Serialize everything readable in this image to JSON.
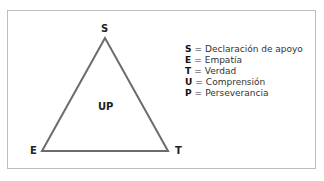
{
  "diagram": {
    "center_label": "UP",
    "vertices": {
      "top": "S",
      "bottom_left": "E",
      "bottom_right": "T"
    },
    "legend": [
      {
        "key": "S",
        "eq": "=",
        "text": "Declaración de apoyo"
      },
      {
        "key": "E",
        "eq": "=",
        "text": "Empatía"
      },
      {
        "key": "T",
        "eq": "=",
        "text": "Verdad"
      },
      {
        "key": "U",
        "eq": "=",
        "text": "Comprensión"
      },
      {
        "key": "P",
        "eq": "=",
        "text": "Perseverancia"
      }
    ],
    "colors": {
      "triangle_stroke": "#6b6b6b",
      "frame_border": "#bdbdbd"
    }
  }
}
